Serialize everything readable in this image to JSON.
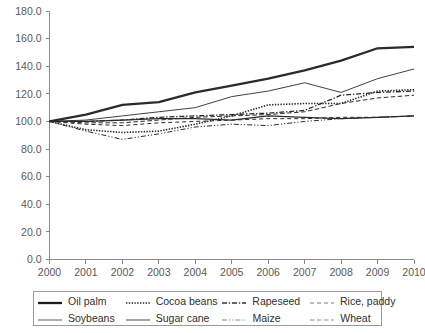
{
  "chart_data": {
    "type": "line",
    "title": "",
    "xlabel": "",
    "ylabel": "",
    "x": [
      2000,
      2001,
      2002,
      2003,
      2004,
      2005,
      2006,
      2007,
      2008,
      2009,
      2010
    ],
    "categories": [
      "2000",
      "2001",
      "2002",
      "2003",
      "2004",
      "2005",
      "2006",
      "2007",
      "2008",
      "2009",
      "2010"
    ],
    "xlim": [
      2000,
      2010
    ],
    "ylim": [
      0.0,
      180.0
    ],
    "yticks": [
      0.0,
      20.0,
      40.0,
      60.0,
      80.0,
      100.0,
      120.0,
      140.0,
      160.0,
      180.0
    ],
    "ytick_labels": [
      "0.0",
      "20.0",
      "40.0",
      "60.0",
      "80.0",
      "100.0",
      "120.0",
      "140.0",
      "160.0",
      "180.0"
    ],
    "grid": false,
    "legend_position": "bottom",
    "series": [
      {
        "name": "Oil palm",
        "style": "solid-thick",
        "values": [
          100,
          105,
          112,
          114,
          121,
          126,
          131,
          137,
          144,
          153,
          154
        ]
      },
      {
        "name": "Cocoa beans",
        "style": "dotted",
        "values": [
          100,
          94,
          92,
          93,
          98,
          104,
          112,
          113,
          113,
          122,
          123
        ]
      },
      {
        "name": "Rapeseed",
        "style": "dash-dot",
        "values": [
          100,
          100,
          101,
          103,
          104,
          105,
          106,
          108,
          119,
          121,
          122
        ]
      },
      {
        "name": "Rice, paddy",
        "style": "dashed",
        "values": [
          100,
          98,
          97,
          99,
          100,
          101,
          102,
          102,
          103,
          103,
          104
        ]
      },
      {
        "name": "Soybeans",
        "style": "solid-thin",
        "values": [
          100,
          101,
          104,
          107,
          110,
          118,
          122,
          128,
          121,
          131,
          138
        ]
      },
      {
        "name": "Sugar cane",
        "style": "solid-medium",
        "values": [
          100,
          100,
          101,
          102,
          102,
          101,
          104,
          103,
          102,
          103,
          104
        ]
      },
      {
        "name": "Maize",
        "style": "dash-dot-dot",
        "values": [
          100,
          93,
          87,
          91,
          96,
          98,
          97,
          100,
          102,
          103,
          104
        ]
      },
      {
        "name": "Wheat",
        "style": "dashed-light",
        "values": [
          100,
          99,
          99,
          101,
          103,
          104,
          105,
          107,
          113,
          117,
          119
        ]
      }
    ]
  },
  "legend": {
    "rows": [
      [
        {
          "label": "Oil palm",
          "style": "solid-thick"
        },
        {
          "label": "Cocoa beans",
          "style": "dotted"
        },
        {
          "label": "Rapeseed",
          "style": "dash-dot"
        },
        {
          "label": "Rice, paddy",
          "style": "dashed"
        }
      ],
      [
        {
          "label": "Soybeans",
          "style": "solid-thin"
        },
        {
          "label": "Sugar cane",
          "style": "solid-medium"
        },
        {
          "label": "Maize",
          "style": "dash-dot-dot"
        },
        {
          "label": "Wheat",
          "style": "dashed-light"
        }
      ]
    ]
  }
}
